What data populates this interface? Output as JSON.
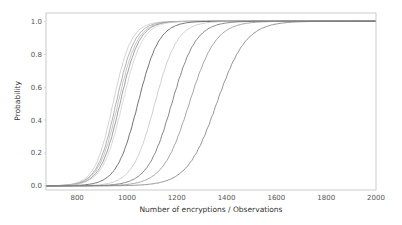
{
  "chart_data": {
    "type": "line",
    "title": "",
    "xlabel": "Number of encryptions / Observations",
    "ylabel": "Probability",
    "xlim": [
      675,
      2000
    ],
    "ylim": [
      -0.025,
      1.05
    ],
    "xticks": [
      800,
      1000,
      1200,
      1400,
      1600,
      1800,
      2000
    ],
    "xtick_labels": [
      "800",
      "1000",
      "1200",
      "1400",
      "1600",
      "1800",
      "2000"
    ],
    "yticks": [
      0.0,
      0.2,
      0.4,
      0.6,
      0.8,
      1.0
    ],
    "ytick_labels": [
      "0.0",
      "0.2",
      "0.4",
      "0.6",
      "0.8",
      "1.0"
    ],
    "grid": false,
    "legend": null,
    "series_model": "cumulative probability (sigmoid-shaped CDF) curves, values read from median crossing (P=0.5) and spread",
    "series": [
      {
        "name": "curve-1",
        "median": 944,
        "scale": 62,
        "color": "#c8c8c8"
      },
      {
        "name": "curve-2",
        "median": 956,
        "scale": 64,
        "color": "#a0a0a0"
      },
      {
        "name": "curve-3",
        "median": 964,
        "scale": 66,
        "color": "#b8b8b8"
      },
      {
        "name": "curve-4",
        "median": 972,
        "scale": 66,
        "color": "#8a8a8a"
      },
      {
        "name": "curve-5",
        "median": 982,
        "scale": 68,
        "color": "#d0d0d0"
      },
      {
        "name": "curve-6",
        "median": 1044,
        "scale": 72,
        "color": "#505050"
      },
      {
        "name": "curve-7",
        "median": 1112,
        "scale": 76,
        "color": "#c4c4c4"
      },
      {
        "name": "curve-8",
        "median": 1180,
        "scale": 82,
        "color": "#6a6a6a"
      },
      {
        "name": "curve-9",
        "median": 1250,
        "scale": 90,
        "color": "#909090"
      },
      {
        "name": "curve-10",
        "median": 1360,
        "scale": 100,
        "color": "#7a7a7a"
      }
    ],
    "x": [
      700,
      800,
      900,
      1000,
      1100,
      1200,
      1300,
      1400,
      1500,
      1600,
      1800,
      2000
    ],
    "values_at_x": {
      "curve-1": [
        0.01,
        0.09,
        0.31,
        0.71,
        0.93,
        0.99,
        1.0,
        1.0,
        1.0,
        1.0,
        1.0,
        1.0
      ],
      "curve-6": [
        0.0,
        0.02,
        0.09,
        0.35,
        0.7,
        0.92,
        0.98,
        1.0,
        1.0,
        1.0,
        1.0,
        1.0
      ],
      "curve-8": [
        0.0,
        0.01,
        0.04,
        0.12,
        0.32,
        0.6,
        0.83,
        0.95,
        0.99,
        1.0,
        1.0,
        1.0
      ],
      "curve-10": [
        0.0,
        0.0,
        0.01,
        0.03,
        0.07,
        0.19,
        0.42,
        0.65,
        0.84,
        0.94,
        0.99,
        1.0
      ]
    }
  },
  "layout": {
    "plot": {
      "left": 46,
      "top": 13,
      "right": 376,
      "bottom": 190
    }
  }
}
